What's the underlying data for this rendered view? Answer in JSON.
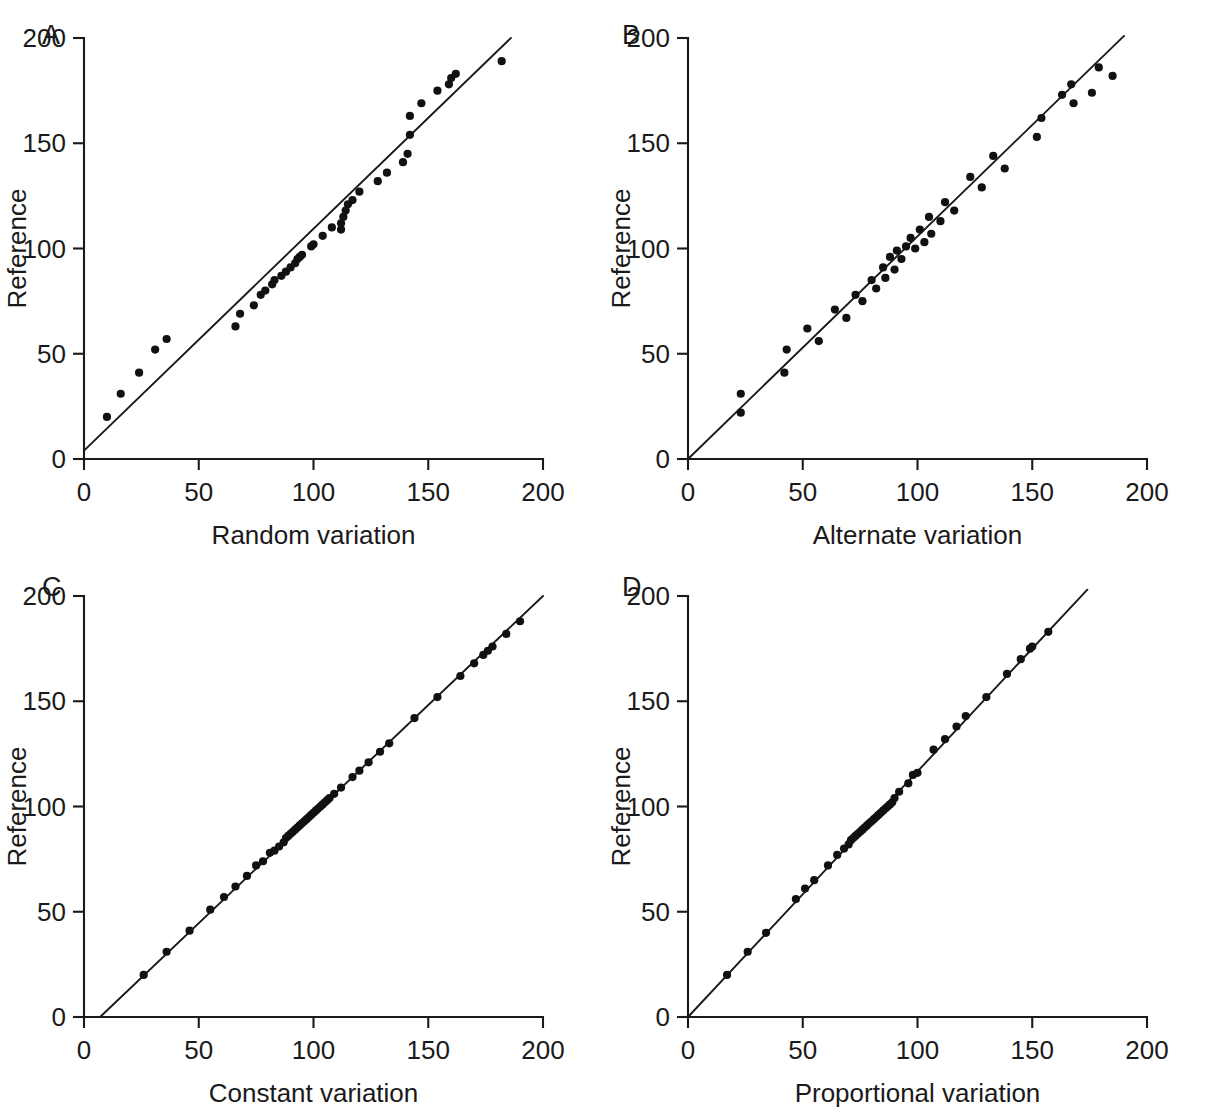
{
  "figure": {
    "panel_count": 4,
    "shared": {
      "ylabel": "Reference",
      "xticks": [
        "0",
        "50",
        "100",
        "150",
        "200"
      ],
      "yticks": [
        "0",
        "50",
        "100",
        "150",
        "200"
      ],
      "xlim": [
        0,
        200
      ],
      "ylim": [
        0,
        200
      ],
      "marker": "filled-circle",
      "line_color": "#1a1a1a",
      "marker_color": "#111111",
      "background": "#ffffff"
    }
  },
  "chart_data": [
    {
      "type": "scatter",
      "panel": "A",
      "title": "",
      "xlabel": "Random variation",
      "ylabel": "Reference",
      "xlim": [
        0,
        200
      ],
      "ylim": [
        0,
        200
      ],
      "xticks": [
        0,
        50,
        100,
        150,
        200
      ],
      "yticks": [
        0,
        50,
        100,
        150,
        200
      ],
      "grid": false,
      "legend": "none",
      "fit_line": {
        "x0": 0,
        "y0": 4,
        "x1": 186,
        "y1": 200
      },
      "points": [
        [
          10,
          20
        ],
        [
          16,
          31
        ],
        [
          24,
          41
        ],
        [
          31,
          52
        ],
        [
          36,
          57
        ],
        [
          66,
          63
        ],
        [
          68,
          69
        ],
        [
          74,
          73
        ],
        [
          77,
          78
        ],
        [
          79,
          80
        ],
        [
          82,
          83
        ],
        [
          83,
          85
        ],
        [
          86,
          87
        ],
        [
          88,
          89
        ],
        [
          90,
          91
        ],
        [
          92,
          93
        ],
        [
          93,
          95
        ],
        [
          94,
          96
        ],
        [
          95,
          97
        ],
        [
          99,
          101
        ],
        [
          100,
          102
        ],
        [
          104,
          106
        ],
        [
          108,
          110
        ],
        [
          112,
          109
        ],
        [
          112,
          112
        ],
        [
          113,
          115
        ],
        [
          114,
          118
        ],
        [
          115,
          121
        ],
        [
          117,
          123
        ],
        [
          120,
          127
        ],
        [
          128,
          132
        ],
        [
          132,
          136
        ],
        [
          139,
          141
        ],
        [
          141,
          145
        ],
        [
          142,
          154
        ],
        [
          142,
          163
        ],
        [
          147,
          169
        ],
        [
          154,
          175
        ],
        [
          159,
          178
        ],
        [
          160,
          181
        ],
        [
          162,
          183
        ],
        [
          182,
          189
        ]
      ]
    },
    {
      "type": "scatter",
      "panel": "B",
      "title": "",
      "xlabel": "Alternate variation",
      "ylabel": "Reference",
      "xlim": [
        0,
        200
      ],
      "ylim": [
        0,
        200
      ],
      "xticks": [
        0,
        50,
        100,
        150,
        200
      ],
      "yticks": [
        0,
        50,
        100,
        150,
        200
      ],
      "grid": false,
      "legend": "none",
      "fit_line": {
        "x0": 0,
        "y0": 0,
        "x1": 190,
        "y1": 201
      },
      "points": [
        [
          23,
          22
        ],
        [
          23,
          31
        ],
        [
          42,
          41
        ],
        [
          43,
          52
        ],
        [
          52,
          62
        ],
        [
          57,
          56
        ],
        [
          64,
          71
        ],
        [
          69,
          67
        ],
        [
          73,
          78
        ],
        [
          76,
          75
        ],
        [
          80,
          85
        ],
        [
          82,
          81
        ],
        [
          85,
          91
        ],
        [
          86,
          86
        ],
        [
          88,
          96
        ],
        [
          90,
          90
        ],
        [
          91,
          99
        ],
        [
          93,
          95
        ],
        [
          95,
          101
        ],
        [
          97,
          105
        ],
        [
          99,
          100
        ],
        [
          101,
          109
        ],
        [
          103,
          103
        ],
        [
          105,
          115
        ],
        [
          106,
          107
        ],
        [
          110,
          113
        ],
        [
          112,
          122
        ],
        [
          116,
          118
        ],
        [
          123,
          134
        ],
        [
          128,
          129
        ],
        [
          133,
          144
        ],
        [
          138,
          138
        ],
        [
          152,
          153
        ],
        [
          154,
          162
        ],
        [
          163,
          173
        ],
        [
          167,
          178
        ],
        [
          168,
          169
        ],
        [
          176,
          174
        ],
        [
          179,
          186
        ],
        [
          185,
          182
        ]
      ]
    },
    {
      "type": "scatter",
      "panel": "C",
      "title": "",
      "xlabel": "Constant variation",
      "ylabel": "Reference",
      "xlim": [
        0,
        200
      ],
      "ylim": [
        0,
        200
      ],
      "xticks": [
        0,
        50,
        100,
        150,
        200
      ],
      "yticks": [
        0,
        50,
        100,
        150,
        200
      ],
      "grid": false,
      "legend": "none",
      "fit_line": {
        "x0": 7,
        "y0": 0,
        "x1": 200,
        "y1": 200
      },
      "points": [
        [
          26,
          20
        ],
        [
          36,
          31
        ],
        [
          46,
          41
        ],
        [
          55,
          51
        ],
        [
          61,
          57
        ],
        [
          66,
          62
        ],
        [
          71,
          67
        ],
        [
          75,
          72
        ],
        [
          78,
          74
        ],
        [
          81,
          78
        ],
        [
          83,
          79
        ],
        [
          85,
          81
        ],
        [
          87,
          83
        ],
        [
          88,
          85
        ],
        [
          89,
          86
        ],
        [
          90,
          87
        ],
        [
          91,
          88
        ],
        [
          92,
          89
        ],
        [
          93,
          90
        ],
        [
          94,
          91
        ],
        [
          95,
          92
        ],
        [
          96,
          93
        ],
        [
          97,
          94
        ],
        [
          98,
          95
        ],
        [
          99,
          96
        ],
        [
          100,
          97
        ],
        [
          101,
          98
        ],
        [
          102,
          99
        ],
        [
          103,
          100
        ],
        [
          104,
          101
        ],
        [
          105,
          102
        ],
        [
          106,
          103
        ],
        [
          107,
          104
        ],
        [
          109,
          106
        ],
        [
          112,
          109
        ],
        [
          117,
          114
        ],
        [
          120,
          117
        ],
        [
          124,
          121
        ],
        [
          129,
          126
        ],
        [
          133,
          130
        ],
        [
          144,
          142
        ],
        [
          154,
          152
        ],
        [
          164,
          162
        ],
        [
          170,
          168
        ],
        [
          174,
          172
        ],
        [
          176,
          174
        ],
        [
          178,
          176
        ],
        [
          184,
          182
        ],
        [
          190,
          188
        ]
      ]
    },
    {
      "type": "scatter",
      "panel": "D",
      "title": "",
      "xlabel": "Proportional variation",
      "ylabel": "Reference",
      "xlim": [
        0,
        200
      ],
      "ylim": [
        0,
        200
      ],
      "xticks": [
        0,
        50,
        100,
        150,
        200
      ],
      "yticks": [
        0,
        50,
        100,
        150,
        200
      ],
      "grid": false,
      "legend": "none",
      "fit_line": {
        "x0": 0,
        "y0": 0,
        "x1": 174,
        "y1": 203
      },
      "points": [
        [
          17,
          20
        ],
        [
          26,
          31
        ],
        [
          34,
          40
        ],
        [
          47,
          56
        ],
        [
          51,
          61
        ],
        [
          55,
          65
        ],
        [
          61,
          72
        ],
        [
          65,
          77
        ],
        [
          68,
          80
        ],
        [
          70,
          82
        ],
        [
          71,
          84
        ],
        [
          72,
          85
        ],
        [
          73,
          86
        ],
        [
          74,
          87
        ],
        [
          75,
          88
        ],
        [
          76,
          89
        ],
        [
          77,
          90
        ],
        [
          78,
          91
        ],
        [
          79,
          92
        ],
        [
          80,
          93
        ],
        [
          81,
          94
        ],
        [
          82,
          95
        ],
        [
          83,
          96
        ],
        [
          84,
          97
        ],
        [
          85,
          98
        ],
        [
          86,
          99
        ],
        [
          87,
          100
        ],
        [
          88,
          101
        ],
        [
          89,
          102
        ],
        [
          90,
          104
        ],
        [
          92,
          107
        ],
        [
          96,
          111
        ],
        [
          98,
          115
        ],
        [
          100,
          116
        ],
        [
          107,
          127
        ],
        [
          112,
          132
        ],
        [
          117,
          138
        ],
        [
          121,
          143
        ],
        [
          130,
          152
        ],
        [
          139,
          163
        ],
        [
          145,
          170
        ],
        [
          149,
          175
        ],
        [
          150,
          176
        ],
        [
          157,
          183
        ]
      ]
    }
  ]
}
